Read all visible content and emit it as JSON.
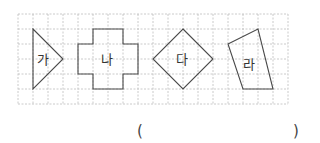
{
  "grid": {
    "origin_x": 18,
    "origin_y": 14,
    "cell": 15,
    "cols": 18,
    "rows": 6,
    "line_color": "#bdbdbd"
  },
  "shapes": [
    {
      "id": "ga",
      "label": "가",
      "points": "33,29 63,59 33,89",
      "label_x": 37,
      "label_y": 64
    },
    {
      "id": "na",
      "label": "나",
      "points": "93,29 123,29 123,44 138,44 138,74 123,74 123,89 93,89 93,74 78,74 78,44 93,44",
      "label_x": 101,
      "label_y": 64
    },
    {
      "id": "da",
      "label": "다",
      "points": "183,29 213,59 183,89 153,59",
      "label_x": 176,
      "label_y": 64
    },
    {
      "id": "ra",
      "label": "라",
      "points": "228,44 258,29 273,89 243,89",
      "label_x": 243,
      "label_y": 69
    }
  ],
  "shape_stroke_color": "#4a4a4a",
  "answer": {
    "open_paren": "(",
    "close_paren": ")",
    "value": ""
  }
}
